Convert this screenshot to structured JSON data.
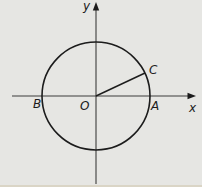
{
  "figure": {
    "type": "diagram",
    "colors": {
      "background": "#e6e6e3",
      "bottom_edge": "#dad5c6",
      "stroke": "#1c1c1c",
      "axis": "#3c3c3c",
      "label": "#1c1c1c"
    },
    "labels": {
      "y_axis": "y",
      "x_axis": "x",
      "origin": "O",
      "point_b": "B",
      "point_a": "A",
      "point_c": "C"
    },
    "geometry": {
      "canvas": {
        "width": 202,
        "height": 187
      },
      "edge_strip": {
        "x": 0,
        "y": 185,
        "width": 202,
        "height": 2
      },
      "circle": {
        "cx": 96,
        "cy": 96,
        "r": 54
      },
      "x_axis": {
        "x1": 12,
        "y1": 96,
        "x2": 189,
        "y2": 96
      },
      "y_axis": {
        "x1": 96,
        "y1": 9,
        "x2": 96,
        "y2": 184
      },
      "radius_line": {
        "x1": 96,
        "y1": 96,
        "x2": 145,
        "y2": 73
      },
      "x_arrow_points": "196,96 187.5,92.8 187.5,99.2",
      "y_arrow_points": "96,2 92.8,10.5 99.2,10.5",
      "label_positions": {
        "y_axis": {
          "x": 83,
          "y": 10
        },
        "x_axis": {
          "x": 189,
          "y": 112
        },
        "origin": {
          "x": 80,
          "y": 110
        },
        "point_b": {
          "x": 33,
          "y": 108
        },
        "point_a": {
          "x": 151,
          "y": 110
        },
        "point_c": {
          "x": 149,
          "y": 74
        }
      }
    }
  }
}
